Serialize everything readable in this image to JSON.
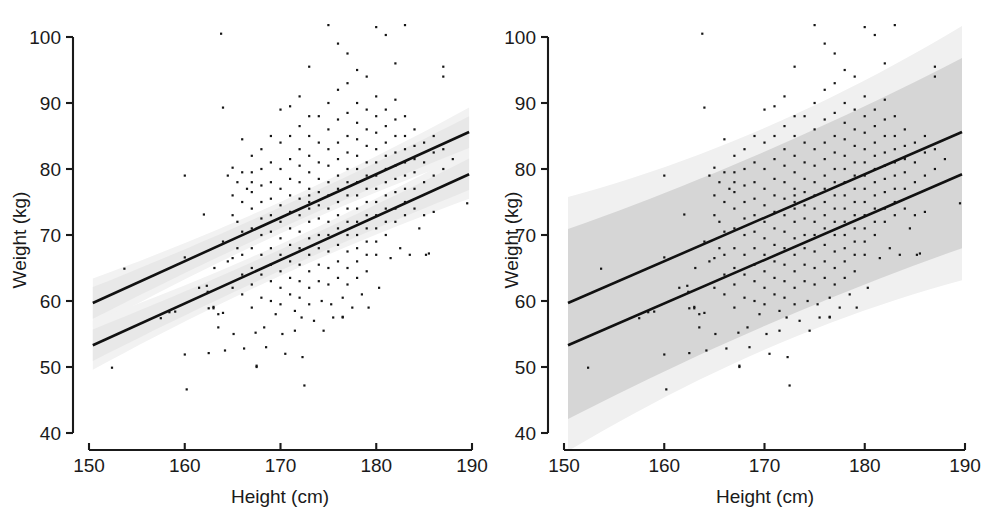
{
  "figure": {
    "panels": [
      {
        "id": "left",
        "band_type": "confidence",
        "band_label": "95% confidence band",
        "bands": [
          {
            "level": "inner",
            "color": "#e8e8e8",
            "half_width_kg": 1.6
          },
          {
            "level": "outer",
            "color": "#f2f2f2",
            "half_width_kg": 2.4
          }
        ]
      },
      {
        "id": "right",
        "band_type": "prediction",
        "band_label": "95% prediction band",
        "bands": [
          {
            "level": "inner",
            "color": "#d6d6d6",
            "half_width_kg": 10.0
          },
          {
            "level": "outer",
            "color": "#f0f0f0",
            "half_width_kg": 13.6
          }
        ]
      }
    ]
  },
  "chart_data": {
    "type": "scatter",
    "title": "",
    "subtitle": "",
    "xlabel": "Height (cm)",
    "ylabel": "Weight (kg)",
    "xlim": [
      150,
      190
    ],
    "ylim": [
      40,
      100
    ],
    "xticks": [
      150,
      160,
      170,
      180,
      190
    ],
    "yticks": [
      40,
      50,
      60,
      70,
      80,
      90,
      100
    ],
    "xtick_labels": [
      "150",
      "160",
      "170",
      "180",
      "190"
    ],
    "ytick_labels": [
      "40",
      "50",
      "60",
      "70",
      "80",
      "90",
      "100"
    ],
    "grid": false,
    "legend": "none",
    "point_color": "#151515",
    "line_color": "#111111",
    "series": [
      {
        "name": "upper regression line",
        "type": "line",
        "x": [
          150.4,
          189.7
        ],
        "y": [
          59.7,
          85.6
        ],
        "slope": 0.659,
        "intercept": -39.3
      },
      {
        "name": "lower regression line",
        "type": "line",
        "x": [
          150.4,
          189.7
        ],
        "y": [
          53.3,
          79.2
        ],
        "slope": 0.659,
        "intercept": -45.7
      }
    ],
    "points": [
      [
        152.4,
        49.9
      ],
      [
        153.7,
        64.9
      ],
      [
        157.5,
        57.4
      ],
      [
        158.4,
        58.3
      ],
      [
        159.0,
        58.4
      ],
      [
        160.0,
        66.6
      ],
      [
        160.0,
        79.0
      ],
      [
        160.0,
        51.9
      ],
      [
        160.2,
        46.6
      ],
      [
        161.5,
        62.0
      ],
      [
        162.0,
        73.1
      ],
      [
        162.3,
        62.3
      ],
      [
        162.4,
        61.4
      ],
      [
        162.5,
        58.9
      ],
      [
        162.5,
        52.1
      ],
      [
        163.0,
        59.1
      ],
      [
        163.0,
        58.9
      ],
      [
        163.1,
        65.0
      ],
      [
        163.5,
        56.0
      ],
      [
        163.5,
        58.0
      ],
      [
        163.8,
        100.5
      ],
      [
        164.0,
        89.3
      ],
      [
        164.0,
        69.0
      ],
      [
        164.0,
        58.2
      ],
      [
        164.2,
        52.5
      ],
      [
        164.5,
        66.0
      ],
      [
        164.5,
        79.0
      ],
      [
        165.0,
        80.2
      ],
      [
        165.0,
        76.0
      ],
      [
        165.0,
        73.0
      ],
      [
        165.0,
        66.5
      ],
      [
        165.0,
        62.0
      ],
      [
        165.1,
        55.0
      ],
      [
        165.5,
        78.0
      ],
      [
        165.5,
        72.0
      ],
      [
        165.5,
        68.0
      ],
      [
        166.0,
        84.5
      ],
      [
        166.0,
        79.5
      ],
      [
        166.0,
        75.0
      ],
      [
        166.0,
        70.5
      ],
      [
        166.0,
        67.0
      ],
      [
        166.0,
        64.0
      ],
      [
        166.0,
        61.0
      ],
      [
        166.2,
        52.8
      ],
      [
        166.5,
        77.0
      ],
      [
        167.0,
        82.0
      ],
      [
        167.0,
        79.5
      ],
      [
        167.0,
        78.0
      ],
      [
        167.0,
        76.5
      ],
      [
        167.0,
        74.0
      ],
      [
        167.0,
        71.0
      ],
      [
        167.0,
        68.0
      ],
      [
        167.0,
        65.0
      ],
      [
        167.0,
        62.5
      ],
      [
        167.0,
        59.0
      ],
      [
        167.4,
        55.2
      ],
      [
        167.5,
        50.0
      ],
      [
        167.5,
        50.2
      ],
      [
        168.0,
        83.0
      ],
      [
        168.0,
        80.0
      ],
      [
        168.0,
        77.5
      ],
      [
        168.0,
        75.0
      ],
      [
        168.0,
        72.5
      ],
      [
        168.0,
        70.0
      ],
      [
        168.0,
        67.0
      ],
      [
        168.0,
        64.0
      ],
      [
        168.0,
        60.5
      ],
      [
        168.3,
        56.0
      ],
      [
        168.5,
        53.0
      ],
      [
        169.0,
        85.0
      ],
      [
        169.0,
        81.0
      ],
      [
        169.0,
        78.0
      ],
      [
        169.0,
        75.5
      ],
      [
        169.0,
        73.0
      ],
      [
        169.0,
        70.5
      ],
      [
        169.0,
        68.0
      ],
      [
        169.0,
        65.5
      ],
      [
        169.0,
        63.0
      ],
      [
        169.0,
        60.0
      ],
      [
        169.5,
        58.0
      ],
      [
        170.0,
        89.0
      ],
      [
        170.0,
        84.0
      ],
      [
        170.0,
        80.0
      ],
      [
        170.0,
        77.0
      ],
      [
        170.0,
        74.5
      ],
      [
        170.0,
        72.0
      ],
      [
        170.0,
        69.5
      ],
      [
        170.0,
        67.0
      ],
      [
        170.0,
        64.5
      ],
      [
        170.0,
        62.0
      ],
      [
        170.0,
        59.5
      ],
      [
        170.2,
        55.0
      ],
      [
        170.5,
        52.0
      ],
      [
        171.0,
        89.5
      ],
      [
        171.0,
        85.0
      ],
      [
        171.0,
        81.5
      ],
      [
        171.0,
        78.5
      ],
      [
        171.0,
        76.0
      ],
      [
        171.0,
        73.5
      ],
      [
        171.0,
        71.0
      ],
      [
        171.0,
        68.5
      ],
      [
        171.0,
        66.0
      ],
      [
        171.0,
        63.5
      ],
      [
        171.0,
        61.0
      ],
      [
        171.5,
        58.5
      ],
      [
        171.5,
        55.5
      ],
      [
        172.0,
        91.0
      ],
      [
        172.0,
        86.5
      ],
      [
        172.0,
        83.0
      ],
      [
        172.0,
        80.5
      ],
      [
        172.0,
        78.0
      ],
      [
        172.0,
        75.5
      ],
      [
        172.0,
        73.0
      ],
      [
        172.0,
        70.5
      ],
      [
        172.0,
        68.0
      ],
      [
        172.0,
        65.5
      ],
      [
        172.0,
        63.0
      ],
      [
        172.0,
        60.5
      ],
      [
        172.2,
        57.5
      ],
      [
        172.3,
        51.5
      ],
      [
        172.5,
        47.2
      ],
      [
        173.0,
        95.5
      ],
      [
        173.0,
        88.0
      ],
      [
        173.0,
        85.0
      ],
      [
        173.0,
        82.0
      ],
      [
        173.0,
        79.5
      ],
      [
        173.0,
        77.0
      ],
      [
        173.0,
        76.0
      ],
      [
        173.0,
        75.0
      ],
      [
        173.0,
        74.0
      ],
      [
        173.0,
        72.0
      ],
      [
        173.0,
        69.5
      ],
      [
        173.0,
        67.0
      ],
      [
        173.0,
        64.5
      ],
      [
        173.0,
        62.0
      ],
      [
        173.0,
        59.5
      ],
      [
        173.5,
        57.0
      ],
      [
        174.0,
        88.0
      ],
      [
        174.0,
        84.0
      ],
      [
        174.0,
        81.0
      ],
      [
        174.0,
        78.5
      ],
      [
        174.0,
        76.5
      ],
      [
        174.0,
        74.5
      ],
      [
        174.0,
        72.5
      ],
      [
        174.0,
        70.0
      ],
      [
        174.0,
        68.0
      ],
      [
        174.0,
        65.5
      ],
      [
        174.0,
        63.0
      ],
      [
        174.3,
        60.0
      ],
      [
        174.5,
        55.5
      ],
      [
        175.0,
        101.8
      ],
      [
        175.0,
        90.0
      ],
      [
        175.0,
        86.0
      ],
      [
        175.0,
        83.0
      ],
      [
        175.0,
        80.5
      ],
      [
        175.0,
        78.0
      ],
      [
        175.0,
        76.0
      ],
      [
        175.0,
        74.0
      ],
      [
        175.0,
        72.0
      ],
      [
        175.0,
        70.0
      ],
      [
        175.0,
        67.5
      ],
      [
        175.0,
        65.0
      ],
      [
        175.0,
        62.5
      ],
      [
        175.3,
        59.5
      ],
      [
        175.5,
        57.5
      ],
      [
        176.0,
        99.0
      ],
      [
        176.0,
        92.0
      ],
      [
        176.0,
        87.5
      ],
      [
        176.0,
        84.0
      ],
      [
        176.0,
        81.5
      ],
      [
        176.0,
        79.0
      ],
      [
        176.0,
        77.0
      ],
      [
        176.0,
        75.0
      ],
      [
        176.0,
        73.0
      ],
      [
        176.0,
        71.0
      ],
      [
        176.0,
        68.5
      ],
      [
        176.0,
        66.0
      ],
      [
        176.0,
        63.5
      ],
      [
        176.5,
        60.5
      ],
      [
        176.5,
        57.5
      ],
      [
        176.5,
        57.6
      ],
      [
        177.0,
        97.5
      ],
      [
        177.0,
        93.0
      ],
      [
        177.0,
        88.5
      ],
      [
        177.0,
        85.0
      ],
      [
        177.0,
        82.5
      ],
      [
        177.0,
        80.0
      ],
      [
        177.0,
        78.0
      ],
      [
        177.0,
        76.0
      ],
      [
        177.0,
        74.0
      ],
      [
        177.0,
        72.0
      ],
      [
        177.0,
        70.0
      ],
      [
        177.0,
        67.5
      ],
      [
        177.0,
        65.0
      ],
      [
        177.0,
        62.5
      ],
      [
        177.5,
        59.0
      ],
      [
        178.0,
        95.0
      ],
      [
        178.0,
        90.0
      ],
      [
        178.0,
        87.0
      ],
      [
        178.0,
        84.5
      ],
      [
        178.0,
        82.0
      ],
      [
        178.0,
        80.0
      ],
      [
        178.0,
        78.0
      ],
      [
        178.0,
        76.0
      ],
      [
        178.0,
        74.0
      ],
      [
        178.0,
        72.0
      ],
      [
        178.0,
        70.0
      ],
      [
        178.0,
        68.0
      ],
      [
        178.0,
        66.0
      ],
      [
        178.0,
        63.5
      ],
      [
        178.5,
        61.0
      ],
      [
        179.0,
        94.0
      ],
      [
        179.0,
        89.0
      ],
      [
        179.0,
        86.0
      ],
      [
        179.0,
        83.5
      ],
      [
        179.0,
        81.0
      ],
      [
        179.0,
        79.0
      ],
      [
        179.0,
        77.0
      ],
      [
        179.0,
        75.0
      ],
      [
        179.0,
        73.0
      ],
      [
        179.0,
        71.0
      ],
      [
        179.0,
        69.0
      ],
      [
        179.0,
        67.0
      ],
      [
        179.0,
        64.5
      ],
      [
        179.2,
        59.0
      ],
      [
        180.0,
        101.5
      ],
      [
        180.0,
        91.0
      ],
      [
        180.0,
        88.0
      ],
      [
        180.0,
        85.5
      ],
      [
        180.0,
        83.0
      ],
      [
        180.0,
        81.0
      ],
      [
        180.0,
        79.0
      ],
      [
        180.0,
        77.0
      ],
      [
        180.0,
        75.0
      ],
      [
        180.0,
        73.0
      ],
      [
        180.0,
        71.0
      ],
      [
        180.0,
        69.0
      ],
      [
        180.0,
        67.0
      ],
      [
        180.3,
        62.0
      ],
      [
        181.0,
        100.3
      ],
      [
        181.0,
        89.0
      ],
      [
        181.0,
        86.5
      ],
      [
        181.0,
        84.0
      ],
      [
        181.0,
        82.0
      ],
      [
        181.0,
        80.0
      ],
      [
        181.0,
        78.0
      ],
      [
        181.0,
        76.0
      ],
      [
        181.0,
        74.0
      ],
      [
        181.0,
        72.0
      ],
      [
        181.0,
        70.0
      ],
      [
        181.5,
        66.5
      ],
      [
        182.0,
        96.0
      ],
      [
        182.0,
        90.5
      ],
      [
        182.0,
        87.5
      ],
      [
        182.0,
        85.0
      ],
      [
        182.0,
        82.5
      ],
      [
        182.0,
        80.5
      ],
      [
        182.0,
        78.5
      ],
      [
        182.0,
        76.5
      ],
      [
        182.0,
        74.0
      ],
      [
        182.0,
        72.0
      ],
      [
        182.5,
        68.0
      ],
      [
        183.0,
        101.8
      ],
      [
        183.0,
        88.0
      ],
      [
        183.0,
        85.0
      ],
      [
        183.0,
        83.0
      ],
      [
        183.0,
        81.0
      ],
      [
        183.0,
        79.0
      ],
      [
        183.0,
        77.0
      ],
      [
        183.0,
        75.0
      ],
      [
        183.0,
        73.0
      ],
      [
        183.5,
        67.0
      ],
      [
        184.0,
        86.0
      ],
      [
        184.0,
        83.5
      ],
      [
        184.0,
        81.5
      ],
      [
        184.0,
        79.5
      ],
      [
        184.0,
        77.0
      ],
      [
        184.0,
        74.0
      ],
      [
        184.5,
        71.0
      ],
      [
        185.0,
        84.0
      ],
      [
        185.0,
        81.0
      ],
      [
        185.0,
        78.0
      ],
      [
        185.0,
        73.0
      ],
      [
        185.2,
        67.0
      ],
      [
        185.5,
        67.2
      ],
      [
        186.0,
        85.0
      ],
      [
        186.0,
        82.5
      ],
      [
        186.0,
        79.0
      ],
      [
        186.0,
        73.5
      ],
      [
        187.0,
        95.5
      ],
      [
        187.0,
        94.0
      ],
      [
        187.0,
        83.0
      ],
      [
        187.0,
        80.0
      ],
      [
        188.0,
        81.5
      ],
      [
        189.5,
        74.8
      ]
    ]
  }
}
